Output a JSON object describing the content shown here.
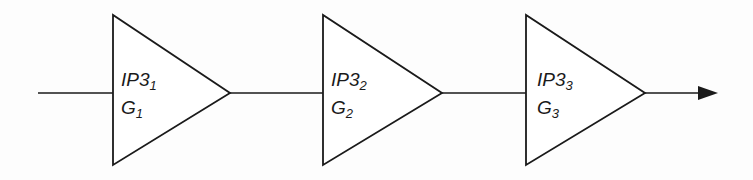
{
  "diagram": {
    "stroke_color": "#1a1a1a",
    "stages": [
      {
        "ip3_main": "IP3",
        "ip3_sub": "1",
        "gain_main": "G",
        "gain_sub": "1"
      },
      {
        "ip3_main": "IP3",
        "ip3_sub": "2",
        "gain_main": "G",
        "gain_sub": "2"
      },
      {
        "ip3_main": "IP3",
        "ip3_sub": "3",
        "gain_main": "G",
        "gain_sub": "3"
      }
    ],
    "input": "input-line",
    "output": "output-arrow"
  }
}
